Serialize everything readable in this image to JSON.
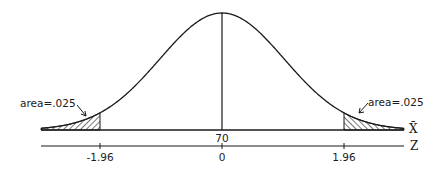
{
  "figure": {
    "colors": {
      "ink": "#1a1a1a",
      "background": "#ffffff"
    }
  },
  "curve": {
    "type": "normal",
    "mean_xbar": "70",
    "mean_z": "0"
  },
  "axes": {
    "xbar": {
      "label": "X̄",
      "center_tick": "70"
    },
    "z": {
      "label": "Z",
      "ticks": [
        "-1.96",
        "0",
        "1.96"
      ]
    }
  },
  "tails": {
    "left": {
      "label": "area=.025",
      "boundary": "-1.96"
    },
    "right": {
      "label": "area=.025",
      "boundary": "1.96"
    }
  },
  "chart_data": {
    "type": "area",
    "title": "",
    "xlabel": "Z",
    "ylabel": "",
    "x_secondary_label": "X̄",
    "ticks_z": [
      -1.96,
      0,
      1.96
    ],
    "ticks_xbar": [
      70
    ],
    "shaded_regions": [
      {
        "from": "-inf",
        "to": -1.96,
        "area": 0.025,
        "label": "area=.025"
      },
      {
        "from": 1.96,
        "to": "inf",
        "area": 0.025,
        "label": "area=.025"
      }
    ],
    "center_line": {
      "z": 0,
      "xbar": 70
    },
    "grid": false,
    "legend": "none"
  }
}
